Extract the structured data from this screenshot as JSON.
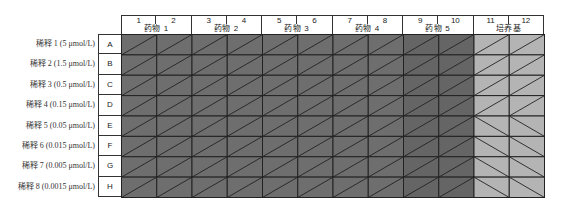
{
  "plate": {
    "columns": [
      "1",
      "2",
      "3",
      "4",
      "5",
      "6",
      "7",
      "8",
      "9",
      "10",
      "11",
      "12"
    ],
    "column_groups": [
      {
        "label": "药物 1",
        "span": [
          1,
          2
        ],
        "color": "#6e6e6e"
      },
      {
        "label": "药物 2",
        "span": [
          3,
          4
        ],
        "color": "#6e6e6e"
      },
      {
        "label": "药物 3",
        "span": [
          5,
          6
        ],
        "color": "#6e6e6e"
      },
      {
        "label": "药物 4",
        "span": [
          7,
          8
        ],
        "color": "#6e6e6e"
      },
      {
        "label": "药物 5",
        "span": [
          9,
          10
        ],
        "color": "#656565"
      },
      {
        "label": "培养基",
        "span": [
          11,
          12
        ],
        "color": "#b4b4b4"
      }
    ],
    "rows": [
      {
        "letter": "A",
        "label": "稀释 1 (5 μmol/L)"
      },
      {
        "letter": "B",
        "label": "稀释 2 (1.5 μmol/L)"
      },
      {
        "letter": "C",
        "label": "稀释 3 (0.5 μmol/L)"
      },
      {
        "letter": "D",
        "label": "稀释 4 (0.15 μmol/L)"
      },
      {
        "letter": "E",
        "label": "稀释 5 (0.05 μmol/L)"
      },
      {
        "letter": "F",
        "label": "稀释 6 (0.015 μmol/L)"
      },
      {
        "letter": "G",
        "label": "稀释 7 (0.005 μmol/L)"
      },
      {
        "letter": "H",
        "label": "稀释 8 (0.0015 μmol/L)"
      }
    ],
    "diagonal_pattern": {
      "drug_wells": "forward-slash",
      "medium_wells_rows_A_D": "forward-slash",
      "medium_wells_rows_E_H": "back-slash"
    },
    "line_color": "#222222"
  }
}
